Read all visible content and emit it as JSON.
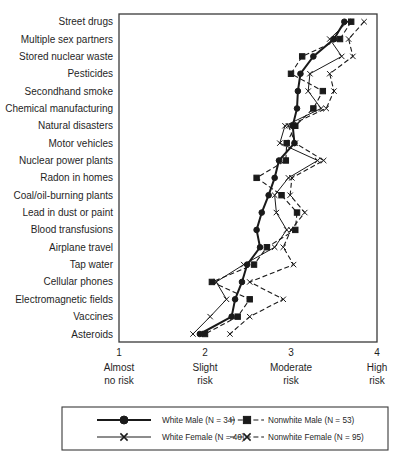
{
  "chart_data": {
    "type": "line",
    "title": "",
    "xlabel": "",
    "ylabel": "",
    "xlim": [
      1,
      4
    ],
    "grid": false,
    "legend_position": "bottom",
    "colors": {
      "ink": "#1a1a1a",
      "background": "#ffffff"
    },
    "categories": [
      "Street drugs",
      "Multiple sex partners",
      "Stored nuclear waste",
      "Pesticides",
      "Secondhand smoke",
      "Chemical manufacturing",
      "Natural disasters",
      "Motor vehicles",
      "Nuclear power plants",
      "Radon in homes",
      "Coal/oil-burning plants",
      "Lead in dust or paint",
      "Blood transfusions",
      "Airplane travel",
      "Tap water",
      "Cellular phones",
      "Electromagnetic fields",
      "Vaccines",
      "Asteroids"
    ],
    "x_axis": {
      "min": 1,
      "max": 4,
      "ticks": [
        {
          "value": "1",
          "label_lines": [
            "Almost",
            "no risk"
          ]
        },
        {
          "value": "2",
          "label_lines": [
            "Slight",
            "risk"
          ]
        },
        {
          "value": "3",
          "label_lines": [
            "Moderate",
            "risk"
          ]
        },
        {
          "value": "4",
          "label_lines": [
            "High",
            "risk"
          ]
        }
      ]
    },
    "series": [
      {
        "name": "white-male",
        "label": "White Male (N = 34)",
        "marker": "circle",
        "line": "solid",
        "weight": "bold",
        "values": [
          3.62,
          3.5,
          3.26,
          3.11,
          3.08,
          3.07,
          3.02,
          3.04,
          2.86,
          2.81,
          2.74,
          2.66,
          2.6,
          2.64,
          2.49,
          2.43,
          2.35,
          2.31,
          1.94
        ]
      },
      {
        "name": "white-female",
        "label": "White Female (N = 40)",
        "marker": "x",
        "line": "solid",
        "weight": "normal",
        "values": [
          3.66,
          3.45,
          3.59,
          3.22,
          3.2,
          3.35,
          2.93,
          2.87,
          3.31,
          2.97,
          2.81,
          2.83,
          2.95,
          2.81,
          2.45,
          2.13,
          2.25,
          2.06,
          1.86
        ]
      },
      {
        "name": "nonwhite-male",
        "label": "Nonwhite Male (N = 53)",
        "marker": "square",
        "line": "dashed",
        "weight": "normal",
        "values": [
          3.7,
          3.57,
          3.13,
          3.0,
          3.37,
          3.26,
          3.05,
          2.95,
          2.94,
          2.6,
          2.89,
          3.07,
          3.05,
          2.72,
          2.57,
          2.08,
          2.52,
          2.38,
          2.0
        ]
      },
      {
        "name": "nonwhite-female",
        "label": "Nonwhite Female (N = 95)",
        "marker": "x",
        "line": "dashed",
        "weight": "normal",
        "values": [
          3.85,
          3.67,
          3.72,
          3.45,
          3.5,
          3.41,
          2.97,
          3.05,
          3.38,
          3.01,
          2.99,
          3.16,
          3.0,
          2.91,
          3.03,
          2.52,
          2.91,
          2.52,
          2.29
        ]
      }
    ]
  }
}
